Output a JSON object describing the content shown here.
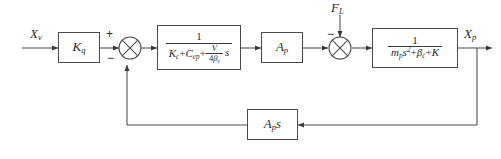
{
  "diagram": {
    "type": "control-block-diagram",
    "stroke_color": "#4a4a4a",
    "text_color": "#2b2b2b",
    "background": "#ffffff"
  },
  "signals": {
    "input_label": "X",
    "input_sub": "v",
    "output_label": "X",
    "output_sub": "p",
    "disturbance_label": "F",
    "disturbance_sub": "L"
  },
  "blocks": {
    "gain": {
      "name": "K",
      "sub": "q"
    },
    "valve_dynamics": {
      "numerator": "1",
      "den_term1": "K",
      "den_term1_sub": "c",
      "den_plus1": "+",
      "den_term2": "C",
      "den_term2_sub": "ep",
      "den_plus2": "+",
      "den_frac_num": "V",
      "den_frac_den_coef": "4",
      "den_frac_den_beta": "β",
      "den_frac_den_sub": "e",
      "den_tail": "s"
    },
    "area": {
      "name": "A",
      "sub": "p"
    },
    "mechanical": {
      "numerator": "1",
      "den_m": "m",
      "den_m_sub": "p",
      "den_s": "s",
      "den_s_exp": "2",
      "den_plus1": "+",
      "den_beta": "β",
      "den_beta_sub": "c",
      "den_plus2": "+",
      "den_k": "K"
    },
    "feedback": {
      "name": "A",
      "sub": "p",
      "tail": "s"
    }
  },
  "summing_junctions": {
    "first": {
      "plus": "+",
      "minus": "−",
      "feedback_sign": ""
    },
    "second": {
      "minus": "−"
    }
  }
}
